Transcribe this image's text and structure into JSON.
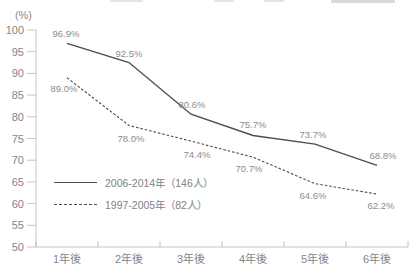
{
  "chart_data": {
    "type": "line",
    "title": "",
    "unit_label": "(%)",
    "categories": [
      "1年後",
      "2年後",
      "3年後",
      "4年後",
      "5年後",
      "6年後"
    ],
    "series": [
      {
        "name": "2006-2014年（146人）",
        "line_style": "solid",
        "values": [
          96.9,
          92.5,
          80.6,
          75.7,
          73.7,
          68.8
        ],
        "labels": [
          "96.9%",
          "92.5%",
          "80.6%",
          "75.7%",
          "73.7%",
          "68.8%"
        ]
      },
      {
        "name": "1997-2005年（82人）",
        "line_style": "dashed",
        "values": [
          89.0,
          78.0,
          74.4,
          70.7,
          64.6,
          62.2
        ],
        "labels": [
          "89.0%",
          "78.0%",
          "74.4%",
          "70.7%",
          "64.6%",
          "62.2%"
        ]
      }
    ],
    "ylim": [
      50,
      100
    ],
    "ytick_step": 5,
    "yticks": [
      50,
      55,
      60,
      65,
      70,
      75,
      80,
      85,
      90,
      95,
      100
    ],
    "grid": false,
    "legend_position": "middle-left",
    "colors": {
      "line": "#4d4d4d",
      "data_label": "#8c8c8c",
      "axis": "#c4c4c4",
      "tick_label": "#858585"
    }
  }
}
